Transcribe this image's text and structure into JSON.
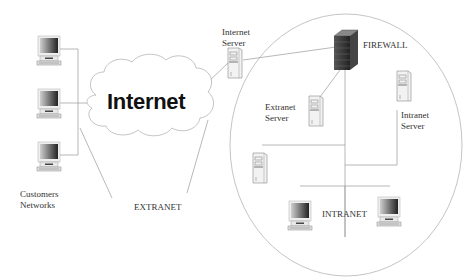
{
  "diagram": {
    "cloud_label": "Internet",
    "labels": {
      "internet_server": [
        "Internet",
        "Server"
      ],
      "firewall": "FIREWALL",
      "extranet_server": [
        "Extranet",
        "Server"
      ],
      "intranet_server": [
        "Intranet",
        "Server"
      ],
      "customers": [
        "Customers",
        "Networks"
      ],
      "extranet": "EXTRANET",
      "intranet": "INTRANET"
    },
    "nodes": [
      {
        "id": "customer-pc-1",
        "type": "workstation-icon"
      },
      {
        "id": "customer-pc-2",
        "type": "workstation-icon"
      },
      {
        "id": "customer-pc-3",
        "type": "workstation-icon"
      },
      {
        "id": "internet-cloud",
        "type": "cloud-icon"
      },
      {
        "id": "internet-server",
        "type": "server-tower-icon"
      },
      {
        "id": "firewall",
        "type": "firewall-icon"
      },
      {
        "id": "extranet-server",
        "type": "server-tower-icon"
      },
      {
        "id": "intranet-server",
        "type": "server-tower-icon"
      },
      {
        "id": "internal-server",
        "type": "server-tower-icon"
      },
      {
        "id": "intranet-pc-1",
        "type": "workstation-icon"
      },
      {
        "id": "intranet-pc-2",
        "type": "workstation-icon"
      }
    ],
    "colors": {
      "line": "#9a9a9a",
      "icon_dark": "#333333",
      "icon_light": "#e6e6e6"
    }
  }
}
